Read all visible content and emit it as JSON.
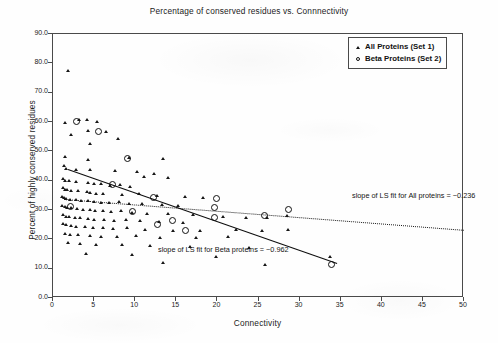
{
  "chart_data": {
    "type": "scatter",
    "title": "Percentage of conserved residues vs. Connnectivity",
    "xlabel": "Connectivity",
    "ylabel": "Percent of highly conserved residues",
    "xlim": [
      0,
      50
    ],
    "ylim": [
      0,
      90
    ],
    "xticks": [
      "0",
      "5",
      "10",
      "15",
      "20",
      "25",
      "30",
      "35",
      "40",
      "45",
      "50"
    ],
    "yticks": [
      "0.0",
      "10.0",
      "20.0",
      "30.0",
      "40.0",
      "50.0",
      "60.0",
      "70.0",
      "80.0",
      "90.0"
    ],
    "grid": false,
    "legend_position": "top-right",
    "series": [
      {
        "name": "All Proteins (Set 1)",
        "marker": "triangle",
        "color": "#161616",
        "points": [
          [
            2.0,
            77.2
          ],
          [
            3.3,
            60.4
          ],
          [
            4.3,
            60.2
          ],
          [
            5.5,
            59.6
          ],
          [
            1.6,
            59.4
          ],
          [
            4.4,
            56.6
          ],
          [
            6.6,
            56.4
          ],
          [
            2.4,
            55.2
          ],
          [
            8.1,
            53.8
          ],
          [
            4.6,
            52.0
          ],
          [
            1.6,
            47.6
          ],
          [
            9.4,
            47.4
          ],
          [
            4.4,
            46.6
          ],
          [
            13.6,
            47.0
          ],
          [
            1.5,
            44.6
          ],
          [
            1.7,
            43.6
          ],
          [
            3.0,
            43.4
          ],
          [
            4.7,
            43.2
          ],
          [
            7.7,
            43.0
          ],
          [
            10.4,
            42.6
          ],
          [
            12.4,
            41.8
          ],
          [
            11.2,
            41.0
          ],
          [
            14.2,
            40.6
          ],
          [
            1.4,
            40.2
          ],
          [
            1.6,
            39.6
          ],
          [
            2.1,
            39.4
          ],
          [
            3.0,
            39.2
          ],
          [
            4.4,
            39.0
          ],
          [
            5.2,
            38.6
          ],
          [
            6.0,
            38.4
          ],
          [
            7.1,
            38.0
          ],
          [
            8.3,
            38.2
          ],
          [
            9.5,
            37.6
          ],
          [
            1.4,
            37.0
          ],
          [
            1.6,
            36.6
          ],
          [
            1.9,
            36.4
          ],
          [
            2.3,
            36.2
          ],
          [
            3.2,
            36.0
          ],
          [
            4.3,
            35.8
          ],
          [
            4.6,
            35.4
          ],
          [
            5.4,
            35.2
          ],
          [
            6.2,
            35.0
          ],
          [
            8.6,
            34.8
          ],
          [
            10.6,
            35.0
          ],
          [
            12.8,
            34.4
          ],
          [
            16.2,
            34.0
          ],
          [
            18.4,
            33.6
          ],
          [
            1.3,
            34.2
          ],
          [
            1.5,
            33.8
          ],
          [
            1.8,
            33.4
          ],
          [
            2.2,
            33.2
          ],
          [
            2.9,
            33.0
          ],
          [
            3.6,
            32.8
          ],
          [
            4.4,
            32.6
          ],
          [
            5.1,
            32.4
          ],
          [
            6.0,
            32.2
          ],
          [
            7.0,
            32.0
          ],
          [
            8.2,
            32.4
          ],
          [
            9.4,
            31.8
          ],
          [
            11.0,
            31.6
          ],
          [
            13.4,
            31.2
          ],
          [
            15.4,
            31.0
          ],
          [
            1.3,
            31.0
          ],
          [
            1.6,
            30.6
          ],
          [
            1.9,
            30.4
          ],
          [
            2.4,
            30.2
          ],
          [
            3.1,
            30.0
          ],
          [
            3.8,
            29.8
          ],
          [
            4.6,
            29.6
          ],
          [
            5.3,
            29.4
          ],
          [
            6.2,
            29.2
          ],
          [
            7.2,
            29.0
          ],
          [
            8.4,
            29.4
          ],
          [
            9.8,
            28.8
          ],
          [
            11.6,
            28.4
          ],
          [
            14.2,
            28.2
          ],
          [
            17.2,
            28.0
          ],
          [
            20.8,
            27.4
          ],
          [
            23.6,
            27.0
          ],
          [
            26.2,
            26.8
          ],
          [
            28.6,
            27.6
          ],
          [
            1.4,
            27.8
          ],
          [
            1.7,
            27.4
          ],
          [
            2.1,
            27.2
          ],
          [
            2.8,
            27.0
          ],
          [
            3.5,
            26.8
          ],
          [
            4.4,
            26.6
          ],
          [
            5.2,
            26.4
          ],
          [
            6.4,
            26.2
          ],
          [
            7.6,
            26.0
          ],
          [
            9.0,
            26.4
          ],
          [
            10.8,
            25.8
          ],
          [
            13.0,
            25.4
          ],
          [
            16.0,
            25.2
          ],
          [
            1.4,
            24.8
          ],
          [
            1.8,
            24.4
          ],
          [
            2.3,
            24.2
          ],
          [
            3.0,
            24.0
          ],
          [
            4.0,
            23.8
          ],
          [
            5.0,
            23.6
          ],
          [
            6.2,
            23.4
          ],
          [
            7.4,
            23.2
          ],
          [
            9.2,
            23.6
          ],
          [
            11.4,
            23.0
          ],
          [
            14.8,
            22.6
          ],
          [
            18.0,
            22.4
          ],
          [
            22.4,
            22.8
          ],
          [
            25.6,
            22.6
          ],
          [
            28.8,
            23.0
          ],
          [
            1.6,
            21.6
          ],
          [
            2.2,
            21.2
          ],
          [
            3.2,
            21.0
          ],
          [
            4.6,
            20.8
          ],
          [
            6.0,
            20.6
          ],
          [
            8.0,
            20.4
          ],
          [
            10.2,
            20.8
          ],
          [
            13.2,
            20.2
          ],
          [
            17.6,
            20.0
          ],
          [
            21.4,
            20.4
          ],
          [
            2.0,
            18.4
          ],
          [
            3.4,
            18.0
          ],
          [
            5.4,
            17.8
          ],
          [
            8.6,
            17.6
          ],
          [
            12.0,
            17.4
          ],
          [
            16.8,
            17.0
          ],
          [
            24.0,
            16.6
          ],
          [
            33.8,
            13.6
          ],
          [
            4.2,
            14.8
          ],
          [
            9.8,
            14.4
          ],
          [
            20.0,
            13.8
          ],
          [
            13.6,
            11.6
          ],
          [
            26.0,
            11.0
          ]
        ]
      },
      {
        "name": "Beta Proteins (Set 2)",
        "marker": "circle",
        "color": "#111111",
        "points": [
          [
            3.0,
            60.0
          ],
          [
            5.6,
            56.4
          ],
          [
            9.2,
            47.2
          ],
          [
            7.4,
            38.2
          ],
          [
            12.4,
            33.8
          ],
          [
            20.0,
            33.6
          ],
          [
            2.2,
            31.0
          ],
          [
            19.8,
            30.6
          ],
          [
            28.8,
            29.8
          ],
          [
            9.8,
            29.2
          ],
          [
            19.8,
            27.2
          ],
          [
            14.6,
            26.2
          ],
          [
            12.8,
            24.6
          ],
          [
            25.8,
            27.8
          ],
          [
            16.2,
            22.8
          ],
          [
            34.0,
            11.0
          ]
        ]
      }
    ],
    "fits": [
      {
        "name": "All proteins",
        "slope": -0.236,
        "style": "dotted",
        "annotation": "slope of LS fit for All proteins = −0.236",
        "x_start": 1.4,
        "y_start": 33.5,
        "x_end": 50.0,
        "y_end": 23.0
      },
      {
        "name": "Beta proteins",
        "slope": -0.962,
        "style": "solid",
        "annotation": "slope of LS fit for Beta proteins = −0.962",
        "x_start": 1.9,
        "y_start": 43.6,
        "x_end": 34.6,
        "y_end": 11.6
      }
    ]
  },
  "legend": {
    "items": [
      {
        "label": "All Proteins (Set 1)",
        "symbol": "triangle-marker"
      },
      {
        "label": "Beta Proteins (Set 2)",
        "symbol": "circle-marker"
      }
    ]
  }
}
